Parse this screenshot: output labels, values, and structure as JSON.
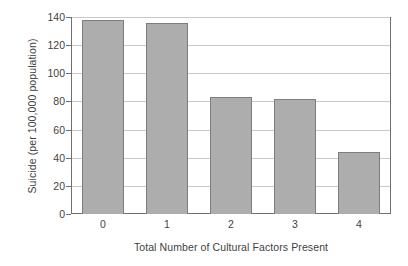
{
  "chart_data": {
    "type": "bar",
    "title": "",
    "subtitle": "",
    "xlabel": "Total Number of Cultural Factors Present",
    "ylabel": "Suicide (per 100,000 population)",
    "categories": [
      "0",
      "1",
      "2",
      "3",
      "4"
    ],
    "values": [
      138,
      136,
      83,
      81.5,
      44
    ],
    "series": [
      {
        "name": "Suicide rate",
        "values": [
          138,
          136,
          83,
          81.5,
          44
        ]
      }
    ],
    "ylim": [
      0,
      140
    ],
    "xlim_categories": 5,
    "yticks": [
      0,
      20,
      40,
      60,
      80,
      100,
      120,
      140
    ],
    "ytick_labels": [
      "0",
      "20",
      "40",
      "60",
      "80",
      "100",
      "120",
      "140"
    ],
    "xtick_labels": [
      "0",
      "1",
      "2",
      "3",
      "4"
    ],
    "grid": "horizontal",
    "legend": "none",
    "annotations": [],
    "colors": {
      "bar_fill": "#adadad",
      "bar_border": "#7d7d7d",
      "gridline": "#c9c9c9",
      "axis_frame": "#6f6f6f",
      "text": "#3f3f3f",
      "background": "#ffffff"
    }
  }
}
